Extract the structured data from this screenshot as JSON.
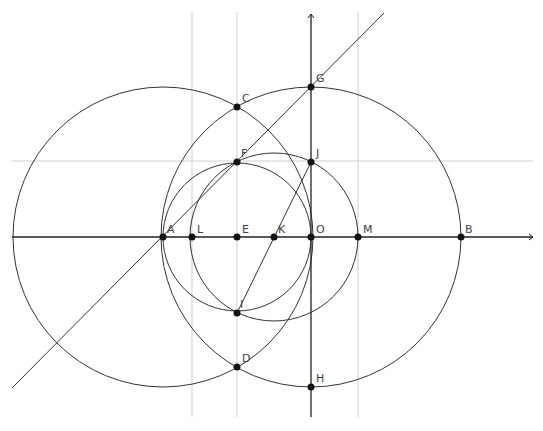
{
  "diagram": {
    "type": "geometric-construction",
    "colors": {
      "curve": "#333333",
      "axis": "#222222",
      "guide": "#cfcfcf",
      "point": "#111111",
      "label": "#444444"
    },
    "axes": {
      "x_axis": {
        "y": 237,
        "x1": 12,
        "x2": 533,
        "arrow": true
      },
      "y_axis": {
        "x": 311,
        "y1": 14,
        "y2": 417,
        "arrow": true
      }
    },
    "guide_lines": {
      "horizontal": [
        {
          "y": 161,
          "x1": 12,
          "x2": 533
        }
      ],
      "vertical": [
        {
          "x": 192,
          "y1": 12,
          "y2": 417
        },
        {
          "x": 237,
          "y1": 12,
          "y2": 417
        },
        {
          "x": 358,
          "y1": 12,
          "y2": 417
        }
      ]
    },
    "lines": [
      {
        "name": "line-AG",
        "x1": 12,
        "y1": 388,
        "x2": 384,
        "y2": 13
      },
      {
        "name": "segment-JI",
        "x1": 311,
        "y1": 162,
        "x2": 237,
        "y2": 313
      }
    ],
    "circles": [
      {
        "name": "circle-A",
        "cx": 163,
        "cy": 237,
        "r": 150
      },
      {
        "name": "circle-O",
        "cx": 311,
        "cy": 237,
        "r": 150
      },
      {
        "name": "circle-E",
        "cx": 237,
        "cy": 237,
        "r": 74
      },
      {
        "name": "circle-K",
        "cx": 274,
        "cy": 237,
        "r": 84
      }
    ],
    "points": [
      {
        "label": "A",
        "x": 163,
        "y": 237,
        "lx": 167,
        "ly": 233
      },
      {
        "label": "L",
        "x": 192,
        "y": 237,
        "lx": 197,
        "ly": 233
      },
      {
        "label": "E",
        "x": 237,
        "y": 237,
        "lx": 242,
        "ly": 233
      },
      {
        "label": "K",
        "x": 274,
        "y": 237,
        "lx": 278,
        "ly": 233
      },
      {
        "label": "O",
        "x": 311,
        "y": 237,
        "lx": 316,
        "ly": 233
      },
      {
        "label": "M",
        "x": 358,
        "y": 237,
        "lx": 363,
        "ly": 233
      },
      {
        "label": "B",
        "x": 461,
        "y": 237,
        "lx": 465,
        "ly": 233
      },
      {
        "label": "C",
        "x": 237,
        "y": 107,
        "lx": 242,
        "ly": 102
      },
      {
        "label": "G",
        "x": 311,
        "y": 87,
        "lx": 316,
        "ly": 82
      },
      {
        "label": "F",
        "x": 237,
        "y": 162,
        "lx": 241,
        "ly": 157
      },
      {
        "label": "J",
        "x": 311,
        "y": 162,
        "lx": 316,
        "ly": 157
      },
      {
        "label": "I",
        "x": 237,
        "y": 313,
        "lx": 240,
        "ly": 308
      },
      {
        "label": "D",
        "x": 237,
        "y": 367,
        "lx": 242,
        "ly": 362
      },
      {
        "label": "H",
        "x": 311,
        "y": 387,
        "lx": 316,
        "ly": 382
      }
    ]
  }
}
